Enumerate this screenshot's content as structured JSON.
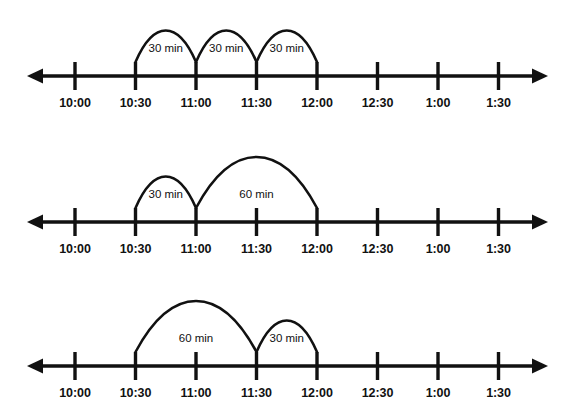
{
  "figure": {
    "background_color": "#ffffff",
    "stroke_color": "#111111",
    "width": 568,
    "height": 418
  },
  "axis": {
    "tick_labels": [
      "10:00",
      "10:30",
      "11:00",
      "11:30",
      "12:00",
      "12:30",
      "1:00",
      "1:30"
    ],
    "left_arrow_icon": "left-arrowhead-icon",
    "right_arrow_icon": "right-arrowhead-icon"
  },
  "timelines": [
    {
      "name": "timeline-1",
      "jumps": [
        {
          "label": "30 min",
          "from": "10:30",
          "to": "11:00",
          "size": "small"
        },
        {
          "label": "30 min",
          "from": "11:00",
          "to": "11:30",
          "size": "small"
        },
        {
          "label": "30 min",
          "from": "11:30",
          "to": "12:00",
          "size": "small"
        }
      ]
    },
    {
      "name": "timeline-2",
      "jumps": [
        {
          "label": "30 min",
          "from": "10:30",
          "to": "11:00",
          "size": "small"
        },
        {
          "label": "60 min",
          "from": "11:00",
          "to": "12:00",
          "size": "large"
        }
      ]
    },
    {
      "name": "timeline-3",
      "jumps": [
        {
          "label": "60 min",
          "from": "10:30",
          "to": "11:30",
          "size": "large"
        },
        {
          "label": "30 min",
          "from": "11:30",
          "to": "12:00",
          "size": "small"
        }
      ]
    }
  ],
  "chart_data": {
    "type": "line",
    "xlabel": "",
    "ylabel": "",
    "categories": [
      "10:00",
      "10:30",
      "11:00",
      "11:30",
      "12:00",
      "12:30",
      "1:00",
      "1:30"
    ],
    "x_tick_values_minutes": [
      600,
      630,
      660,
      690,
      720,
      750,
      780,
      810
    ],
    "axis_type": "number-line",
    "grid": false,
    "legend": false,
    "series": [
      {
        "name": "timeline-1",
        "jumps": [
          {
            "start": "10:30",
            "end": "11:00",
            "value": 30,
            "label": "30 min"
          },
          {
            "start": "11:00",
            "end": "11:30",
            "value": 30,
            "label": "30 min"
          },
          {
            "start": "11:30",
            "end": "12:00",
            "value": 30,
            "label": "30 min"
          }
        ],
        "total_minutes": 90
      },
      {
        "name": "timeline-2",
        "jumps": [
          {
            "start": "10:30",
            "end": "11:00",
            "value": 30,
            "label": "30 min"
          },
          {
            "start": "11:00",
            "end": "12:00",
            "value": 60,
            "label": "60 min"
          }
        ],
        "total_minutes": 90
      },
      {
        "name": "timeline-3",
        "jumps": [
          {
            "start": "10:30",
            "end": "11:30",
            "value": 60,
            "label": "60 min"
          },
          {
            "start": "11:30",
            "end": "12:00",
            "value": 30,
            "label": "30 min"
          }
        ],
        "total_minutes": 90
      }
    ]
  }
}
